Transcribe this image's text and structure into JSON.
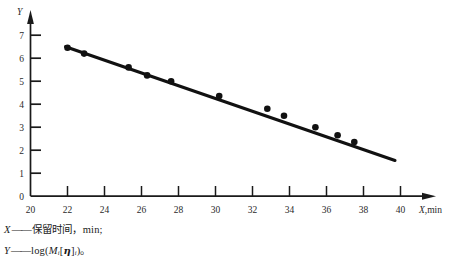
{
  "chart_data": {
    "type": "scatter",
    "title": "",
    "subtitle": "",
    "xlabel": "X,min",
    "ylabel": "Y",
    "xlim": [
      20,
      40.8
    ],
    "ylim": [
      0,
      7.4
    ],
    "xticks": [
      20,
      22,
      24,
      26,
      28,
      30,
      32,
      34,
      36,
      38,
      40
    ],
    "yticks": [
      0,
      1,
      2,
      3,
      4,
      5,
      6,
      7
    ],
    "xtick_labels": [
      "20",
      "22",
      "24",
      "26",
      "28",
      "30",
      "32",
      "34",
      "36",
      "38",
      "40"
    ],
    "ytick_labels": [
      "0",
      "1",
      "2",
      "3",
      "4",
      "5",
      "6",
      "7"
    ],
    "grid": false,
    "legend_position": "none",
    "x_axis_name": "X",
    "x_axis_unit": ",min",
    "y_axis_name": "Y",
    "series": [
      {
        "name": "calibration points",
        "marker": "filled-circle",
        "color": "#111111",
        "x": [
          22.0,
          22.9,
          25.3,
          26.3,
          27.6,
          30.2,
          32.8,
          33.7,
          35.4,
          36.6,
          37.5
        ],
        "y": [
          6.45,
          6.2,
          5.6,
          5.25,
          5.0,
          4.35,
          3.8,
          3.5,
          3.0,
          2.65,
          2.35
        ]
      },
      {
        "name": "fitted line",
        "marker": "none",
        "color": "#111111",
        "x": [
          21.9,
          39.7
        ],
        "y": [
          6.5,
          1.55
        ]
      }
    ],
    "annotations": []
  },
  "caption": {
    "line1": {
      "var": "X",
      "dash": "——",
      "text_cjk": "保留时间",
      "comma": "，",
      "unit": "min",
      "terminator": ";"
    },
    "line2": {
      "var": "Y",
      "dash": "——",
      "fn": "log(",
      "m": "M",
      "m_sub": "i",
      "bracket_open": "[",
      "eta": "η",
      "bracket_close": "]",
      "eta_sub": "i",
      "paren_close": ")",
      "terminator": "。"
    }
  }
}
